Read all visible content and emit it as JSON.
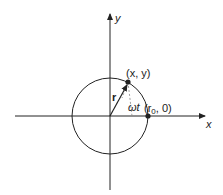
{
  "diagram": {
    "type": "circular-motion",
    "axes": {
      "x_label": "x",
      "y_label": "y"
    },
    "point_moving_label": "(x, y)",
    "point_start_label_prefix": "(r",
    "point_start_label_sub": "0",
    "point_start_label_suffix": ", 0)",
    "vector_label": "r",
    "angle_label": "ωt",
    "colors": {
      "stroke": "#222222",
      "dashed": "#888888",
      "background": "#ffffff"
    }
  }
}
